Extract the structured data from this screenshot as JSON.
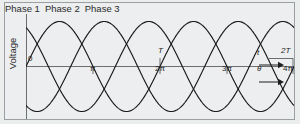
{
  "figure": {
    "background_color": "#eceded",
    "frame_color": "#9aa0a2",
    "curve_color": "#1a1a1a",
    "axis_color": "#6b6f71"
  },
  "phase_labels": [
    {
      "name": "phase-1",
      "label": "Phase 1"
    },
    {
      "name": "phase-2",
      "label": "Phase 2"
    },
    {
      "name": "phase-3",
      "label": "Phase 3"
    }
  ],
  "axes": {
    "y_title": "Voltage",
    "origin_label": "0",
    "angle_ticks": [
      "π",
      "2π",
      "3π",
      "4π"
    ],
    "time_ticks": [
      "T",
      "2T"
    ],
    "time_axis_symbol": "t",
    "angle_axis_symbol": "θ"
  },
  "chart_data": {
    "type": "line",
    "title": "",
    "xlabel": "θ",
    "ylabel": "Voltage",
    "grid": false,
    "legend": "top",
    "xlim": [
      0,
      12.566
    ],
    "ylim": [
      -1.15,
      1.15
    ],
    "x_tick_values": [
      3.1416,
      6.2832,
      9.4248,
      12.5664
    ],
    "x_tick_labels": [
      "π",
      "2π",
      "3π",
      "4π"
    ],
    "secondary_x_tick_values": [
      6.2832,
      12.5664
    ],
    "secondary_x_tick_labels": [
      "T",
      "2T"
    ],
    "series": [
      {
        "name": "Phase 1",
        "phase_deg": 0,
        "amplitude": 1,
        "periods": 2
      },
      {
        "name": "Phase 2",
        "phase_deg": 120,
        "amplitude": 1,
        "periods": 2
      },
      {
        "name": "Phase 3",
        "phase_deg": 240,
        "amplitude": 1,
        "periods": 2
      }
    ]
  }
}
